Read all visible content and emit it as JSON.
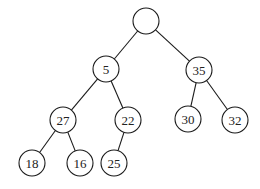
{
  "diagram": {
    "type": "binary-tree",
    "radius": 13,
    "nodes": [
      {
        "id": "root",
        "label": "",
        "x": 146,
        "y": 21
      },
      {
        "id": "n5",
        "label": "5",
        "x": 106,
        "y": 69
      },
      {
        "id": "n35",
        "label": "35",
        "x": 199,
        "y": 70
      },
      {
        "id": "n27",
        "label": "27",
        "x": 63,
        "y": 120
      },
      {
        "id": "n22",
        "label": "22",
        "x": 128,
        "y": 120
      },
      {
        "id": "n30",
        "label": "30",
        "x": 188,
        "y": 119
      },
      {
        "id": "n32",
        "label": "32",
        "x": 235,
        "y": 120
      },
      {
        "id": "n18",
        "label": "18",
        "x": 32,
        "y": 163
      },
      {
        "id": "n16",
        "label": "16",
        "x": 80,
        "y": 163
      },
      {
        "id": "n25",
        "label": "25",
        "x": 114,
        "y": 163
      }
    ],
    "edges": [
      [
        "root",
        "n5"
      ],
      [
        "root",
        "n35"
      ],
      [
        "n5",
        "n27"
      ],
      [
        "n5",
        "n22"
      ],
      [
        "n35",
        "n30"
      ],
      [
        "n35",
        "n32"
      ],
      [
        "n27",
        "n18"
      ],
      [
        "n27",
        "n16"
      ],
      [
        "n22",
        "n25"
      ]
    ]
  }
}
